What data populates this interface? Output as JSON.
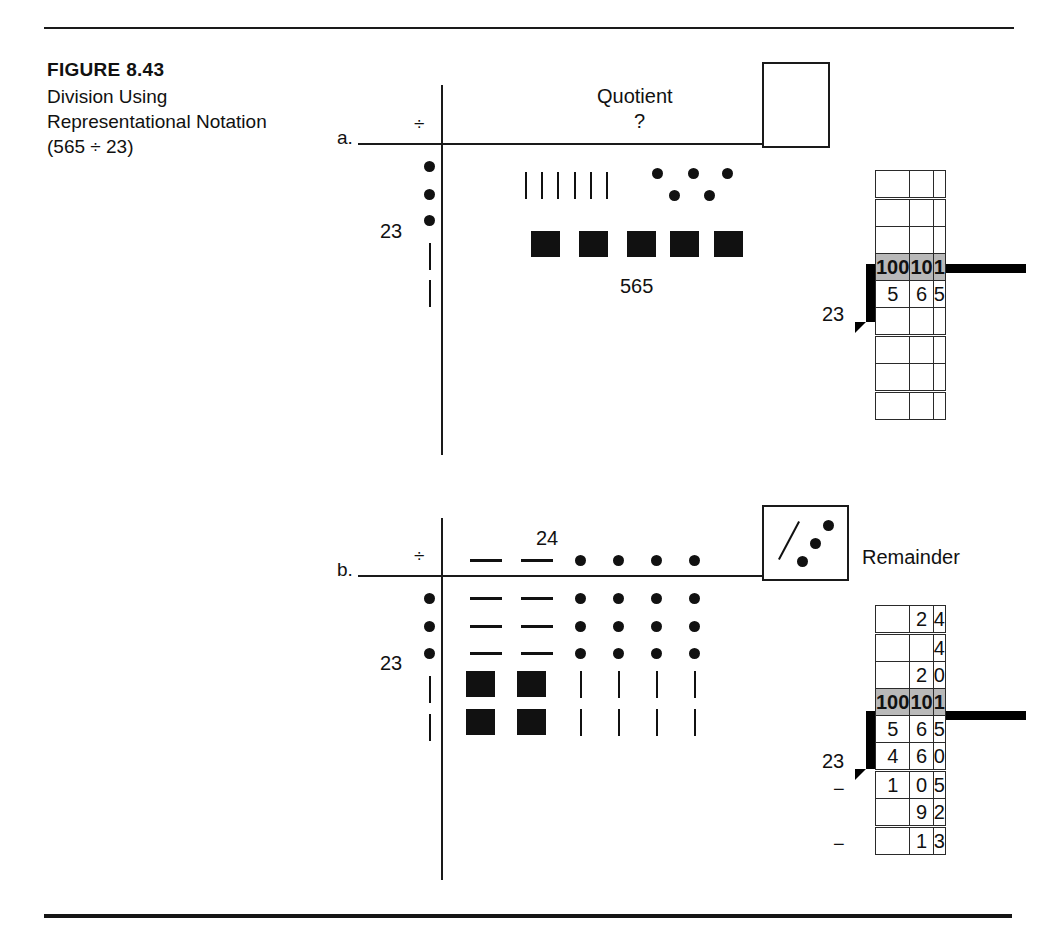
{
  "caption": {
    "figure_number": "FIGURE 8.43",
    "title_line1": "Division Using",
    "title_line2": "Representational Notation",
    "title_line3": "(565 ÷ 23)"
  },
  "part_a": {
    "label": "a.",
    "division_symbol": "÷",
    "divisor_label": "23",
    "quotient_word": "Quotient",
    "quotient_value": "?",
    "dividend_label": "565",
    "divisor_tens_dots": 3,
    "divisor_ones_tallies": 2,
    "dividend_hundreds_squares": 5,
    "dividend_tens_dots": 6,
    "dividend_ones_tallies": 5
  },
  "part_b": {
    "label": "b.",
    "division_symbol": "÷",
    "divisor_label": "23",
    "quotient_label": "24",
    "quotient_tens_dashes": 2,
    "quotient_ones_dots": 4,
    "divisor_tens_dots": 3,
    "divisor_ones_tallies": 2,
    "array_dash_rows": 3,
    "array_dash_cols": 2,
    "array_dot_rows": 3,
    "array_dot_cols": 4,
    "array_square_rows": 2,
    "array_square_cols": 2,
    "array_tally_rows": 2,
    "array_tally_cols": 4,
    "remainder_word": "Remainder",
    "remainder_tens_slashes": 1,
    "remainder_ones_dots": 3
  },
  "table_a": {
    "side_label": "23",
    "header": [
      "100",
      "10",
      "1"
    ],
    "rows": [
      {
        "cells": [
          "",
          "",
          ""
        ],
        "double_top": false
      },
      {
        "cells": [
          "",
          "",
          ""
        ],
        "double_top": true
      },
      {
        "cells": [
          "",
          "",
          ""
        ],
        "double_top": false
      },
      {
        "cells": [
          "5",
          "6",
          "5"
        ],
        "double_top": false
      },
      {
        "cells": [
          "",
          "",
          ""
        ],
        "double_top": false
      },
      {
        "cells": [
          "",
          "",
          ""
        ],
        "double_top": true
      },
      {
        "cells": [
          "",
          "",
          ""
        ],
        "double_top": false
      },
      {
        "cells": [
          "",
          "",
          ""
        ],
        "double_top": true
      }
    ]
  },
  "table_b": {
    "side_label": "23",
    "header": [
      "100",
      "10",
      "1"
    ],
    "minus_row_1": "−",
    "minus_row_2": "−",
    "rows_above": [
      {
        "cells": [
          "",
          "2",
          "4"
        ],
        "double_top": false
      },
      {
        "cells": [
          "",
          "",
          "4"
        ],
        "double_top": true
      },
      {
        "cells": [
          "",
          "2",
          "0"
        ],
        "double_top": false
      }
    ],
    "rows_below": [
      {
        "cells": [
          "5",
          "6",
          "5"
        ],
        "double_top": false
      },
      {
        "cells": [
          "4",
          "6",
          "0"
        ],
        "double_top": false
      },
      {
        "cells": [
          "1",
          "0",
          "5"
        ],
        "double_top": true
      },
      {
        "cells": [
          "",
          "9",
          "2"
        ],
        "double_top": false
      },
      {
        "cells": [
          "",
          "1",
          "3"
        ],
        "double_top": true
      }
    ]
  },
  "colors": {
    "ink": "#111111",
    "header_gray": "#b9b9b9"
  }
}
